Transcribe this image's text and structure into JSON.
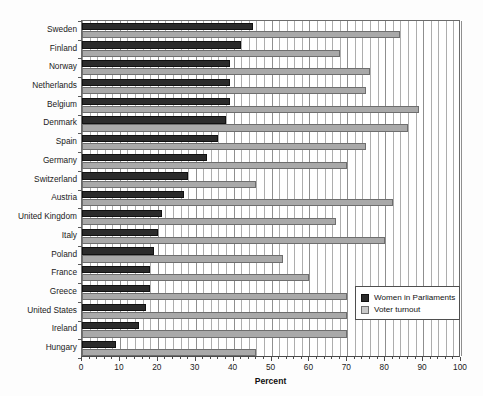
{
  "chart_data": {
    "type": "bar",
    "orientation": "horizontal",
    "title": "",
    "xlabel": "Percent",
    "ylabel": "",
    "xlim": [
      0,
      100
    ],
    "xticks": [
      0,
      10,
      20,
      30,
      40,
      50,
      60,
      70,
      80,
      90,
      100
    ],
    "xtick_labels": [
      "0",
      "10",
      "20",
      "30",
      "40",
      "50",
      "60",
      "70",
      "80",
      "90",
      "100"
    ],
    "grid": true,
    "grid_axis": "x",
    "grid_minor_step": 2,
    "legend_position": "lower-right-inside",
    "categories": [
      "Sweden",
      "Finland",
      "Norway",
      "Netherlands",
      "Belgium",
      "Denmark",
      "Spain",
      "Germany",
      "Switzerland",
      "Austria",
      "United Kingdom",
      "Italy",
      "Poland",
      "France",
      "Greece",
      "United States",
      "Ireland",
      "Hungary"
    ],
    "series": [
      {
        "name": "Women in Parliaments",
        "color": "#2b2b2b",
        "values": [
          45,
          42,
          39,
          39,
          39,
          38,
          36,
          33,
          28,
          27,
          21,
          20,
          19,
          18,
          18,
          17,
          15,
          9
        ]
      },
      {
        "name": "Voter turnout",
        "color": "#a9a9a9",
        "values": [
          84,
          68,
          76,
          75,
          89,
          86,
          75,
          70,
          46,
          82,
          67,
          80,
          53,
          60,
          70,
          70,
          70,
          46
        ]
      }
    ]
  },
  "legend": {
    "items": [
      {
        "label": "Women in Parliaments",
        "swatch": "dark"
      },
      {
        "label": "Voter turnout",
        "swatch": "light"
      }
    ]
  }
}
